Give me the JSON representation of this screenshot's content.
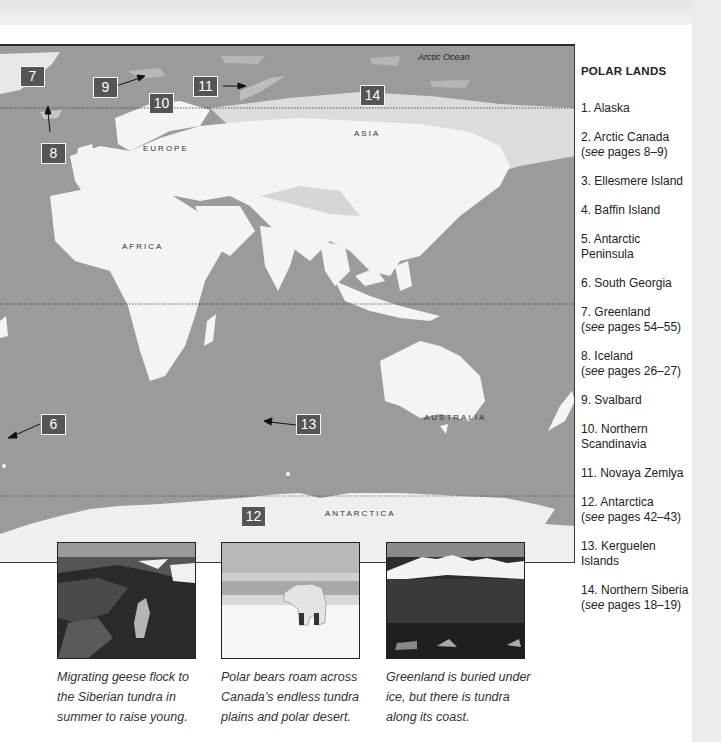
{
  "map": {
    "ocean_color": "#9b9b9b",
    "land_color": "#f4f4f4",
    "ocean_label": "Arctic Ocean",
    "continent_labels": {
      "europe": "EUROPE",
      "asia": "ASIA",
      "africa": "AFRICA",
      "australia": "AUSTRALIA",
      "antarctica": "ANTARCTICA"
    },
    "markers": {
      "m6": "6",
      "m7": "7",
      "m8": "8",
      "m9": "9",
      "m10": "10",
      "m11": "11",
      "m12": "12",
      "m13": "13",
      "m14": "14"
    },
    "marker_color": "#555555"
  },
  "legend": {
    "title": "POLAR LANDS",
    "items": [
      {
        "text": "1. Alaska",
        "see": "",
        "pages": ""
      },
      {
        "text": "2. Arctic Canada",
        "see": "see",
        "pages": " pages 8–9)"
      },
      {
        "text": "3. Ellesmere Island",
        "see": "",
        "pages": ""
      },
      {
        "text": "4. Baffin Island",
        "see": "",
        "pages": ""
      },
      {
        "text": "5. Antarctic Peninsula",
        "see": "",
        "pages": ""
      },
      {
        "text": "6. South Georgia",
        "see": "",
        "pages": ""
      },
      {
        "text": "7. Greenland",
        "see": "see",
        "pages": " pages 54–55)"
      },
      {
        "text": "8. Iceland",
        "see": "see",
        "pages": " pages 26–27)"
      },
      {
        "text": "9. Svalbard",
        "see": "",
        "pages": ""
      },
      {
        "text": "10. Northern Scandinavia",
        "see": "",
        "pages": ""
      },
      {
        "text": "11. Novaya Zemlya",
        "see": "",
        "pages": ""
      },
      {
        "text": "12. Antarctica",
        "see": "see",
        "pages": " pages 42–43)"
      },
      {
        "text": "13. Kerguelen Islands",
        "see": "",
        "pages": ""
      },
      {
        "text": "14. Northern Siberia",
        "see": "see",
        "pages": " pages 18–19)"
      }
    ]
  },
  "photos": [
    {
      "subject": "geese-in-tundra",
      "caption": "Migrating geese flock to the Siberian tundra in summer to raise young."
    },
    {
      "subject": "polar-bear-on-ice",
      "caption": "Polar bears roam across Canada’s endless tundra plains and polar desert."
    },
    {
      "subject": "greenland-coast",
      "caption": "Greenland is buried under ice, but there is tundra along its coast."
    }
  ]
}
